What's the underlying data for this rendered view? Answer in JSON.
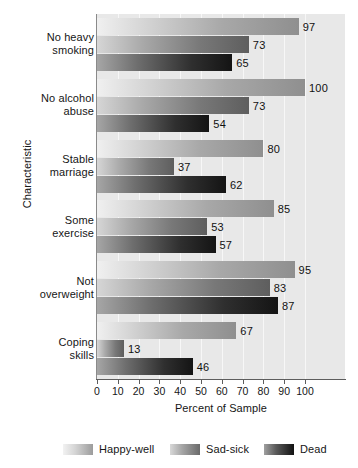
{
  "chart_data": {
    "type": "bar",
    "orientation": "horizontal",
    "title": "",
    "xlabel": "Percent of Sample",
    "ylabel": "Characteristic",
    "xlim": [
      0,
      120
    ],
    "xticks": [
      0,
      10,
      20,
      30,
      40,
      50,
      60,
      70,
      80,
      90,
      100
    ],
    "xtick_labels": [
      "0",
      "10",
      "20",
      "30",
      "40",
      "50",
      "60",
      "70",
      "80",
      "90",
      "100"
    ],
    "grid": true,
    "legend_position": "bottom",
    "categories": [
      "No heavy smoking",
      "No alcohol abuse",
      "Stable marriage",
      "Some exercise",
      "Not overweight",
      "Coping skills"
    ],
    "category_lines": [
      [
        "No heavy",
        "smoking"
      ],
      [
        "No alcohol",
        "abuse"
      ],
      [
        "Stable",
        "marriage"
      ],
      [
        "Some",
        "exercise"
      ],
      [
        "Not",
        "overweight"
      ],
      [
        "Coping",
        "skills"
      ]
    ],
    "series": [
      {
        "name": "Happy-well",
        "color": "#a8a8a8",
        "values": [
          97,
          100,
          80,
          85,
          95,
          67
        ],
        "labels": [
          "97",
          "100",
          "80",
          "85",
          "95",
          "67"
        ]
      },
      {
        "name": "Sad-sick",
        "color": "#6e6e6e",
        "values": [
          73,
          73,
          37,
          53,
          83,
          13
        ],
        "labels": [
          "73",
          "73",
          "37",
          "53",
          "83",
          "13"
        ]
      },
      {
        "name": "Dead",
        "color": "#1b1b1b",
        "values": [
          65,
          54,
          62,
          57,
          87,
          46
        ],
        "labels": [
          "65",
          "54",
          "62",
          "57",
          "87",
          "46"
        ]
      }
    ]
  },
  "legend": {
    "items": [
      {
        "label": "Happy-well"
      },
      {
        "label": "Sad-sick"
      },
      {
        "label": "Dead"
      }
    ]
  }
}
